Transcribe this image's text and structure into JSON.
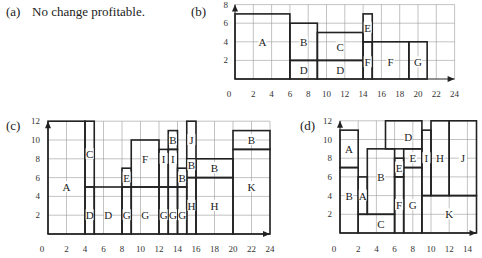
{
  "panels": {
    "a": {
      "label": "(a)",
      "text": "No change profitable."
    },
    "b": {
      "label": "(b)"
    },
    "c": {
      "label": "(c)"
    },
    "d": {
      "label": "(d)"
    }
  },
  "chart_data": [
    {
      "id": "b",
      "type": "diagram",
      "title": "(b)",
      "xlim": [
        0,
        24
      ],
      "ylim": [
        0,
        8
      ],
      "xticks": [
        0,
        2,
        4,
        6,
        8,
        10,
        12,
        14,
        16,
        18,
        20,
        22,
        24
      ],
      "yticks": [
        2,
        4,
        6,
        8
      ],
      "grid": true,
      "rects": [
        {
          "x0": 0,
          "x1": 6,
          "y0": 0,
          "y1": 7
        },
        {
          "x0": 6,
          "x1": 9,
          "y0": 2,
          "y1": 6
        },
        {
          "x0": 6,
          "x1": 9,
          "y0": 0,
          "y1": 2
        },
        {
          "x0": 9,
          "x1": 14,
          "y0": 2,
          "y1": 5
        },
        {
          "x0": 9,
          "x1": 14,
          "y0": 0,
          "y1": 2
        },
        {
          "x0": 14,
          "x1": 15,
          "y0": 4,
          "y1": 7
        },
        {
          "x0": 14,
          "x1": 15,
          "y0": 0,
          "y1": 4
        },
        {
          "x0": 15,
          "x1": 19,
          "y0": 0,
          "y1": 4
        },
        {
          "x0": 19,
          "x1": 21,
          "y0": 0,
          "y1": 4
        }
      ],
      "labels": [
        {
          "text": "A",
          "x": 3,
          "y": 4
        },
        {
          "text": "B",
          "x": 7.5,
          "y": 4
        },
        {
          "text": "C",
          "x": 11.5,
          "y": 3.4
        },
        {
          "text": "D",
          "x": 7.5,
          "y": 1
        },
        {
          "text": "D",
          "x": 11.5,
          "y": 1
        },
        {
          "text": "E",
          "x": 14.5,
          "y": 5.5
        },
        {
          "text": "F",
          "x": 14.5,
          "y": 1.8
        },
        {
          "text": "F",
          "x": 17,
          "y": 1.8
        },
        {
          "text": "G",
          "x": 20,
          "y": 1.8
        }
      ]
    },
    {
      "id": "c",
      "type": "diagram",
      "title": "(c)",
      "xlim": [
        0,
        24
      ],
      "ylim": [
        0,
        12
      ],
      "xticks": [
        0,
        2,
        4,
        6,
        8,
        10,
        12,
        14,
        16,
        18,
        20,
        22,
        24
      ],
      "yticks": [
        2,
        4,
        6,
        8,
        10,
        12
      ],
      "grid": true,
      "rects": [
        {
          "x0": 0,
          "x1": 4,
          "y0": 0,
          "y1": 12
        },
        {
          "x0": 4,
          "x1": 5,
          "y0": 5,
          "y1": 12
        },
        {
          "x0": 4,
          "x1": 5,
          "y0": 0,
          "y1": 5
        },
        {
          "x0": 5,
          "x1": 8,
          "y0": 0,
          "y1": 5
        },
        {
          "x0": 8,
          "x1": 9,
          "y0": 5,
          "y1": 7
        },
        {
          "x0": 8,
          "x1": 9,
          "y0": 0,
          "y1": 5
        },
        {
          "x0": 9,
          "x1": 12,
          "y0": 5,
          "y1": 10
        },
        {
          "x0": 9,
          "x1": 12,
          "y0": 0,
          "y1": 5
        },
        {
          "x0": 12,
          "x1": 13,
          "y0": 5,
          "y1": 9
        },
        {
          "x0": 12,
          "x1": 13,
          "y0": 0,
          "y1": 5
        },
        {
          "x0": 13,
          "x1": 14,
          "y0": 9,
          "y1": 11
        },
        {
          "x0": 13,
          "x1": 14,
          "y0": 5,
          "y1": 9
        },
        {
          "x0": 13,
          "x1": 14,
          "y0": 0,
          "y1": 5
        },
        {
          "x0": 14,
          "x1": 15,
          "y0": 5,
          "y1": 7
        },
        {
          "x0": 14,
          "x1": 15,
          "y0": 0,
          "y1": 5
        },
        {
          "x0": 15,
          "x1": 16,
          "y0": 8,
          "y1": 12
        },
        {
          "x0": 15,
          "x1": 16,
          "y0": 6,
          "y1": 8
        },
        {
          "x0": 15,
          "x1": 16,
          "y0": 0,
          "y1": 6
        },
        {
          "x0": 16,
          "x1": 20,
          "y0": 6,
          "y1": 8
        },
        {
          "x0": 16,
          "x1": 20,
          "y0": 0,
          "y1": 6
        },
        {
          "x0": 20,
          "x1": 24,
          "y0": 9,
          "y1": 11
        },
        {
          "x0": 20,
          "x1": 24,
          "y0": 0,
          "y1": 9
        }
      ],
      "labels": [
        {
          "text": "A",
          "x": 2,
          "y": 5
        },
        {
          "text": "C",
          "x": 4.5,
          "y": 8.5
        },
        {
          "text": "D",
          "x": 4.5,
          "y": 2
        },
        {
          "text": "D",
          "x": 6.5,
          "y": 2
        },
        {
          "text": "E",
          "x": 8.5,
          "y": 6
        },
        {
          "text": "G",
          "x": 8.5,
          "y": 2
        },
        {
          "text": "F",
          "x": 10.5,
          "y": 8
        },
        {
          "text": "G",
          "x": 10.5,
          "y": 2
        },
        {
          "text": "I",
          "x": 12.5,
          "y": 8
        },
        {
          "text": "G",
          "x": 12.5,
          "y": 2
        },
        {
          "text": "B",
          "x": 13.5,
          "y": 10
        },
        {
          "text": "I",
          "x": 13.5,
          "y": 8
        },
        {
          "text": "G",
          "x": 13.5,
          "y": 2
        },
        {
          "text": "B",
          "x": 14.5,
          "y": 6
        },
        {
          "text": "G",
          "x": 14.5,
          "y": 2
        },
        {
          "text": "J",
          "x": 15.5,
          "y": 10
        },
        {
          "text": "B",
          "x": 15.5,
          "y": 7.3
        },
        {
          "text": "H",
          "x": 15.5,
          "y": 3
        },
        {
          "text": "B",
          "x": 18,
          "y": 7
        },
        {
          "text": "H",
          "x": 18,
          "y": 3
        },
        {
          "text": "B",
          "x": 22,
          "y": 10
        },
        {
          "text": "K",
          "x": 22,
          "y": 5
        }
      ]
    },
    {
      "id": "d",
      "type": "diagram",
      "title": "(d)",
      "xlim": [
        0,
        15
      ],
      "ylim": [
        0,
        12
      ],
      "xticks": [
        0,
        2,
        4,
        6,
        8,
        10,
        12,
        14
      ],
      "yticks": [
        2,
        4,
        6,
        8,
        10,
        12
      ],
      "grid": true,
      "rects": [
        {
          "x0": 0,
          "x1": 2,
          "y0": 7,
          "y1": 11
        },
        {
          "x0": 0,
          "x1": 2,
          "y0": 0,
          "y1": 7
        },
        {
          "x0": 2,
          "x1": 3,
          "y0": 2,
          "y1": 6
        },
        {
          "x0": 3,
          "x1": 6,
          "y0": 2,
          "y1": 9
        },
        {
          "x0": 2,
          "x1": 6,
          "y0": 0,
          "y1": 2
        },
        {
          "x0": 5,
          "x1": 9,
          "y0": 9,
          "y1": 12
        },
        {
          "x0": 6,
          "x1": 7,
          "y0": 6,
          "y1": 8
        },
        {
          "x0": 6,
          "x1": 7,
          "y0": 0,
          "y1": 6
        },
        {
          "x0": 7,
          "x1": 9,
          "y0": 7,
          "y1": 9
        },
        {
          "x0": 7,
          "x1": 9,
          "y0": 0,
          "y1": 7
        },
        {
          "x0": 9,
          "x1": 10,
          "y0": 4,
          "y1": 11
        },
        {
          "x0": 10,
          "x1": 12,
          "y0": 4,
          "y1": 12
        },
        {
          "x0": 12,
          "x1": 15,
          "y0": 4,
          "y1": 12
        },
        {
          "x0": 9,
          "x1": 15,
          "y0": 0,
          "y1": 4
        }
      ],
      "labels": [
        {
          "text": "A",
          "x": 1,
          "y": 9
        },
        {
          "text": "B",
          "x": 1,
          "y": 4
        },
        {
          "text": "A",
          "x": 2.5,
          "y": 4
        },
        {
          "text": "B",
          "x": 4.5,
          "y": 6
        },
        {
          "text": "C",
          "x": 4.5,
          "y": 1
        },
        {
          "text": "D",
          "x": 7.5,
          "y": 10.3
        },
        {
          "text": "E",
          "x": 6.5,
          "y": 7
        },
        {
          "text": "E",
          "x": 8,
          "y": 8
        },
        {
          "text": "F",
          "x": 6.5,
          "y": 3
        },
        {
          "text": "G",
          "x": 8,
          "y": 3
        },
        {
          "text": "I",
          "x": 9.5,
          "y": 8
        },
        {
          "text": "H",
          "x": 11,
          "y": 8
        },
        {
          "text": "J",
          "x": 13.5,
          "y": 8
        },
        {
          "text": "K",
          "x": 12,
          "y": 2
        }
      ]
    }
  ]
}
